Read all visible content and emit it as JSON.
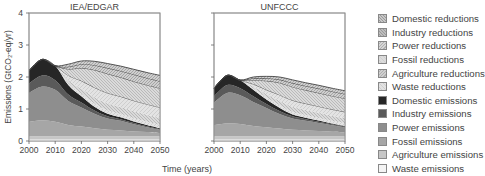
{
  "chart_data": [
    {
      "type": "area",
      "title": "IEA/EDGAR",
      "xlabel": "Time (years)",
      "ylabel": "Emissions (GtCO2-eq/yr)",
      "xlim": [
        2000,
        2050
      ],
      "ylim": [
        0,
        4
      ],
      "xticks": [
        2000,
        2010,
        2020,
        2030,
        2040,
        2050
      ],
      "yticks": [
        0,
        1,
        2,
        3,
        4
      ],
      "grid": false,
      "x": [
        2000,
        2005,
        2010,
        2015,
        2020,
        2025,
        2030,
        2035,
        2040,
        2045,
        2050
      ],
      "series": [
        {
          "name": "Waste emissions",
          "values": [
            0.05,
            0.05,
            0.05,
            0.05,
            0.05,
            0.05,
            0.05,
            0.05,
            0.05,
            0.05,
            0.05
          ]
        },
        {
          "name": "Agriculture emissions",
          "values": [
            0.1,
            0.1,
            0.1,
            0.1,
            0.1,
            0.1,
            0.1,
            0.1,
            0.1,
            0.1,
            0.1
          ]
        },
        {
          "name": "Fossil emissions",
          "values": [
            0.45,
            0.5,
            0.45,
            0.35,
            0.3,
            0.25,
            0.2,
            0.18,
            0.15,
            0.13,
            0.1
          ]
        },
        {
          "name": "Power emissions",
          "values": [
            0.9,
            1.05,
            1.0,
            0.75,
            0.6,
            0.45,
            0.35,
            0.3,
            0.22,
            0.15,
            0.1
          ]
        },
        {
          "name": "Industry emissions",
          "values": [
            0.3,
            0.35,
            0.3,
            0.2,
            0.15,
            0.1,
            0.07,
            0.05,
            0.04,
            0.03,
            0.02
          ]
        },
        {
          "name": "Domestic emissions",
          "values": [
            0.4,
            0.5,
            0.45,
            0.3,
            0.2,
            0.12,
            0.08,
            0.06,
            0.05,
            0.04,
            0.03
          ]
        },
        {
          "name": "Waste reductions",
          "values": [
            0,
            0,
            0,
            0.05,
            0.08,
            0.1,
            0.1,
            0.1,
            0.1,
            0.1,
            0.1
          ]
        },
        {
          "name": "Agriculture reductions",
          "values": [
            0,
            0,
            0,
            0.1,
            0.15,
            0.2,
            0.22,
            0.22,
            0.22,
            0.22,
            0.22
          ]
        },
        {
          "name": "Fossil reductions",
          "values": [
            0,
            0,
            0,
            0.15,
            0.25,
            0.3,
            0.33,
            0.33,
            0.33,
            0.33,
            0.33
          ]
        },
        {
          "name": "Power reductions",
          "values": [
            0,
            0,
            0,
            0.2,
            0.4,
            0.55,
            0.6,
            0.6,
            0.6,
            0.6,
            0.6
          ]
        },
        {
          "name": "Industry reductions",
          "values": [
            0,
            0,
            0,
            0.07,
            0.12,
            0.15,
            0.18,
            0.2,
            0.22,
            0.22,
            0.22
          ]
        },
        {
          "name": "Domestic reductions",
          "values": [
            0,
            0,
            0,
            0.08,
            0.1,
            0.12,
            0.14,
            0.15,
            0.16,
            0.17,
            0.18
          ]
        }
      ]
    },
    {
      "type": "area",
      "title": "UNFCCC",
      "xlabel": "Time (years)",
      "ylabel": "Emissions (GtCO2-eq/yr)",
      "xlim": [
        2000,
        2050
      ],
      "ylim": [
        0,
        4
      ],
      "xticks": [
        2000,
        2010,
        2020,
        2030,
        2040,
        2050
      ],
      "yticks": [
        0,
        1,
        2,
        3,
        4
      ],
      "grid": false,
      "x": [
        2000,
        2005,
        2010,
        2015,
        2020,
        2025,
        2030,
        2035,
        2040,
        2045,
        2050
      ],
      "series": [
        {
          "name": "Waste emissions",
          "values": [
            0.05,
            0.05,
            0.05,
            0.05,
            0.05,
            0.05,
            0.05,
            0.05,
            0.05,
            0.05,
            0.05
          ]
        },
        {
          "name": "Agriculture emissions",
          "values": [
            0.1,
            0.1,
            0.1,
            0.1,
            0.1,
            0.1,
            0.1,
            0.1,
            0.1,
            0.1,
            0.1
          ]
        },
        {
          "name": "Fossil emissions",
          "values": [
            0.35,
            0.4,
            0.38,
            0.32,
            0.28,
            0.24,
            0.2,
            0.18,
            0.16,
            0.14,
            0.12
          ]
        },
        {
          "name": "Power emissions",
          "values": [
            0.7,
            0.95,
            0.9,
            0.75,
            0.6,
            0.45,
            0.35,
            0.3,
            0.25,
            0.2,
            0.15
          ]
        },
        {
          "name": "Industry emissions",
          "values": [
            0.2,
            0.25,
            0.22,
            0.18,
            0.13,
            0.1,
            0.07,
            0.05,
            0.04,
            0.03,
            0.03
          ]
        },
        {
          "name": "Domestic emissions",
          "values": [
            0.25,
            0.3,
            0.25,
            0.2,
            0.14,
            0.1,
            0.06,
            0.05,
            0.04,
            0.03,
            0.02
          ]
        },
        {
          "name": "Waste reductions",
          "values": [
            0,
            0,
            0,
            0.04,
            0.06,
            0.08,
            0.08,
            0.08,
            0.08,
            0.08,
            0.08
          ]
        },
        {
          "name": "Agriculture reductions",
          "values": [
            0,
            0,
            0,
            0.06,
            0.1,
            0.14,
            0.16,
            0.16,
            0.16,
            0.16,
            0.16
          ]
        },
        {
          "name": "Fossil reductions",
          "values": [
            0,
            0,
            0,
            0.08,
            0.14,
            0.18,
            0.2,
            0.2,
            0.2,
            0.2,
            0.2
          ]
        },
        {
          "name": "Power reductions",
          "values": [
            0,
            0,
            0,
            0.12,
            0.28,
            0.38,
            0.42,
            0.42,
            0.42,
            0.42,
            0.42
          ]
        },
        {
          "name": "Industry reductions",
          "values": [
            0,
            0,
            0,
            0.06,
            0.08,
            0.1,
            0.12,
            0.13,
            0.14,
            0.14,
            0.14
          ]
        },
        {
          "name": "Domestic reductions",
          "values": [
            0,
            0,
            0,
            0.04,
            0.06,
            0.08,
            0.1,
            0.1,
            0.1,
            0.1,
            0.1
          ]
        }
      ]
    }
  ],
  "figure": {
    "panel_titles": [
      "IEA/EDGAR",
      "UNFCCC"
    ],
    "xlabel": "Time (years)",
    "ylabel": "Emissions (GtCO₂-eq/yr)",
    "xtick_labels": [
      "2000",
      "2010",
      "2020",
      "2030",
      "2040",
      "2050"
    ],
    "ytick_labels": [
      "0",
      "1",
      "2",
      "3",
      "4"
    ]
  },
  "legend": {
    "items": [
      {
        "label": "Domestic reductions",
        "color": "#c8c8c8",
        "pattern": "dense-hatch"
      },
      {
        "label": "Industry reductions",
        "color": "#bdbdbd",
        "pattern": "dense-hatch"
      },
      {
        "label": "Power reductions",
        "color": "#d6d6d6",
        "pattern": "hatch"
      },
      {
        "label": "Fossil reductions",
        "color": "#dcdcdc",
        "pattern": "light"
      },
      {
        "label": "Agriculture reductions",
        "color": "#d0d0d0",
        "pattern": "hatch"
      },
      {
        "label": "Waste reductions",
        "color": "#e2e2e2",
        "pattern": "light"
      },
      {
        "label": "Domestic emissions",
        "color": "#262626",
        "pattern": "solid"
      },
      {
        "label": "Industry emissions",
        "color": "#5a5a5a",
        "pattern": "solid"
      },
      {
        "label": "Power emissions",
        "color": "#8e8e8e",
        "pattern": "solid"
      },
      {
        "label": "Fossil emissions",
        "color": "#a6a6a6",
        "pattern": "solid"
      },
      {
        "label": "Agriculture emissions",
        "color": "#c6c6c6",
        "pattern": "solid"
      },
      {
        "label": "Waste emissions",
        "color": "#f4f4f4",
        "pattern": "solid"
      }
    ]
  }
}
